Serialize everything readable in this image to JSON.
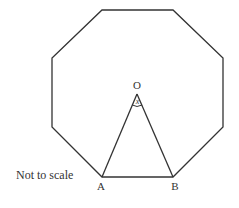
{
  "diagram": {
    "shape": "regular octagon",
    "labels": {
      "center": "O",
      "angle": "x",
      "vertex_a": "A",
      "vertex_b": "B",
      "note": "Not to scale"
    },
    "colors": {
      "stroke": "#333333",
      "background": "#ffffff"
    }
  }
}
